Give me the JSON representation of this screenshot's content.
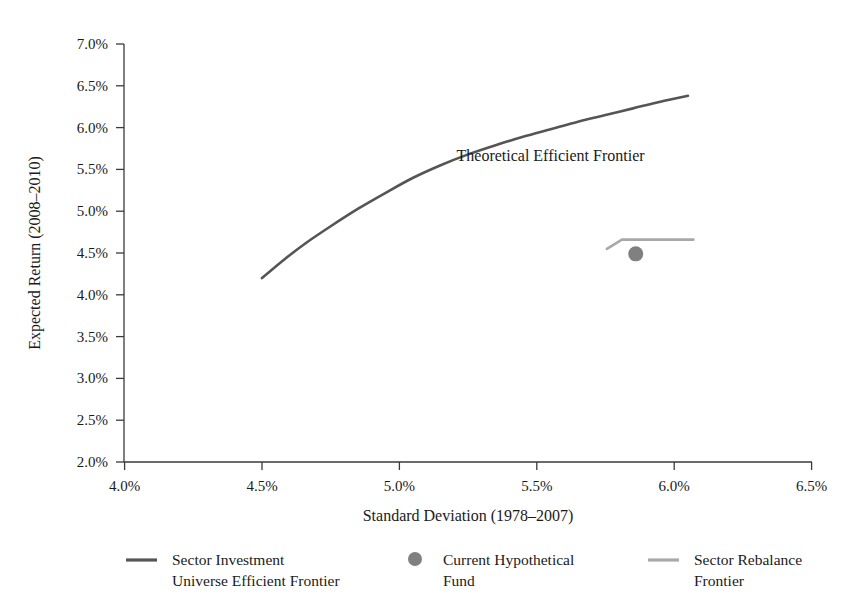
{
  "chart_data": {
    "type": "line",
    "title": "",
    "xlabel": "Standard Deviation (1978–2007)",
    "ylabel": "Expected Return (2008–2010)",
    "xlim": [
      4.0,
      6.5
    ],
    "ylim": [
      2.0,
      7.0
    ],
    "xticks": [
      "4.0%",
      "4.5%",
      "5.0%",
      "5.5%",
      "6.0%",
      "6.5%"
    ],
    "xtick_values": [
      4.0,
      4.5,
      5.0,
      5.5,
      6.0,
      6.5
    ],
    "yticks": [
      "2.0%",
      "2.5%",
      "3.0%",
      "3.5%",
      "4.0%",
      "4.5%",
      "5.0%",
      "5.5%",
      "6.0%",
      "6.5%",
      "7.0%"
    ],
    "ytick_values": [
      2.0,
      2.5,
      3.0,
      3.5,
      4.0,
      4.5,
      5.0,
      5.5,
      6.0,
      6.5,
      7.0
    ],
    "grid": false,
    "legend_position": "bottom",
    "annotations": [
      {
        "text": "Theoretical Efficient Frontier",
        "x": 5.55,
        "y": 5.6
      }
    ],
    "series": [
      {
        "name": "Sector Investment Universe Efficient Frontier",
        "type": "line",
        "color": "#555555",
        "points": [
          {
            "x": 4.5,
            "y": 4.2
          },
          {
            "x": 4.58,
            "y": 4.42
          },
          {
            "x": 4.66,
            "y": 4.62
          },
          {
            "x": 4.75,
            "y": 4.82
          },
          {
            "x": 4.85,
            "y": 5.03
          },
          {
            "x": 4.95,
            "y": 5.22
          },
          {
            "x": 5.05,
            "y": 5.4
          },
          {
            "x": 5.15,
            "y": 5.55
          },
          {
            "x": 5.25,
            "y": 5.68
          },
          {
            "x": 5.35,
            "y": 5.79
          },
          {
            "x": 5.45,
            "y": 5.89
          },
          {
            "x": 5.55,
            "y": 5.98
          },
          {
            "x": 5.65,
            "y": 6.07
          },
          {
            "x": 5.75,
            "y": 6.15
          },
          {
            "x": 5.85,
            "y": 6.23
          },
          {
            "x": 5.95,
            "y": 6.31
          },
          {
            "x": 6.05,
            "y": 6.38
          }
        ]
      },
      {
        "name": "Sector Rebalance Frontier",
        "type": "line",
        "color": "#a8a8a8",
        "points": [
          {
            "x": 5.755,
            "y": 4.55
          },
          {
            "x": 5.81,
            "y": 4.66
          },
          {
            "x": 6.07,
            "y": 4.66
          }
        ]
      },
      {
        "name": "Current Hypothetical Fund",
        "type": "scatter",
        "color": "#808080",
        "points": [
          {
            "x": 5.86,
            "y": 4.49
          }
        ]
      }
    ]
  },
  "legend": {
    "items": [
      {
        "marker": "line",
        "color": "#555555",
        "line1": "Sector Investment",
        "line2": "Universe Efficient Frontier"
      },
      {
        "marker": "dot",
        "color": "#808080",
        "line1": "Current Hypothetical",
        "line2": "Fund"
      },
      {
        "marker": "line",
        "color": "#a8a8a8",
        "line1": "Sector Rebalance",
        "line2": "Frontier"
      }
    ]
  }
}
